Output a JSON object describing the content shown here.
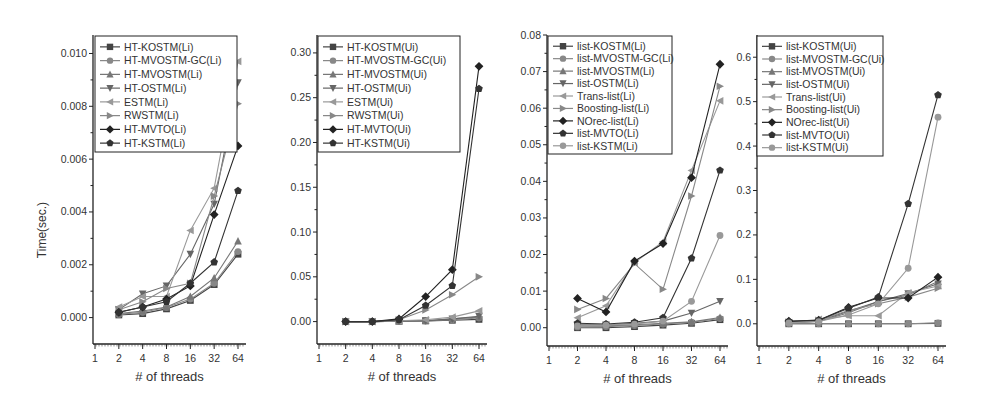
{
  "figure": {
    "y_axis_title": "Time(sec.)",
    "x_axis_title": "# of threads"
  },
  "chart_data": [
    {
      "type": "line",
      "title": "",
      "xlabel": "# of threads",
      "ylabel": "Time(sec.)",
      "x_scale": "log2",
      "categories": [
        "2",
        "4",
        "8",
        "16",
        "32",
        "64"
      ],
      "x_ticks": [
        "1",
        "2",
        "4",
        "8",
        "16",
        "32",
        "64"
      ],
      "y_ticks": [
        "0.000",
        "0.002",
        "0.004",
        "0.006",
        "0.008",
        "0.010"
      ],
      "ylim": [
        -0.001,
        0.0107
      ],
      "legend_position": "upper-left",
      "grid": false,
      "series": [
        {
          "name": "HT-KOSTM(Li)",
          "marker": "square",
          "color": "#444444",
          "values": [
            0.0001,
            0.00015,
            0.00033,
            0.00065,
            0.00125,
            0.0024
          ]
        },
        {
          "name": "HT-MVOSTM-GC(Li)",
          "marker": "circle",
          "color": "#888888",
          "values": [
            0.00012,
            0.0002,
            0.00038,
            0.0007,
            0.0013,
            0.0025
          ]
        },
        {
          "name": "HT-MVOSTM(Li)",
          "marker": "triangle-up",
          "color": "#777777",
          "values": [
            0.00015,
            0.00025,
            0.0004,
            0.0008,
            0.0015,
            0.0029
          ]
        },
        {
          "name": "HT-OSTM(Li)",
          "marker": "triangle-down",
          "color": "#666666",
          "values": [
            0.0003,
            0.0009,
            0.0012,
            0.0024,
            0.0043,
            0.0089
          ]
        },
        {
          "name": "ESTM(Li)",
          "marker": "triangle-left",
          "color": "#999999",
          "values": [
            0.0004,
            0.0008,
            0.0008,
            0.0033,
            0.0049,
            0.0097
          ]
        },
        {
          "name": "RWSTM(Li)",
          "marker": "triangle-right",
          "color": "#888888",
          "values": [
            0.0003,
            0.0006,
            0.0011,
            0.0013,
            0.0046,
            0.0081
          ]
        },
        {
          "name": "HT-MVTO(Li)",
          "marker": "diamond",
          "color": "#222222",
          "values": [
            0.0002,
            0.0004,
            0.0007,
            0.0012,
            0.0039,
            0.0065
          ]
        },
        {
          "name": "HT-KSTM(Li)",
          "marker": "pentagon",
          "color": "#333333",
          "values": [
            0.0002,
            0.0004,
            0.0006,
            0.0013,
            0.0021,
            0.0048
          ]
        }
      ]
    },
    {
      "type": "line",
      "title": "",
      "xlabel": "# of threads",
      "ylabel": "",
      "x_scale": "log2",
      "categories": [
        "2",
        "4",
        "8",
        "16",
        "32",
        "64"
      ],
      "x_ticks": [
        "1",
        "2",
        "4",
        "8",
        "16",
        "32",
        "64"
      ],
      "y_ticks": [
        "0.00",
        "0.05",
        "0.10",
        "0.15",
        "0.20",
        "0.25",
        "0.30"
      ],
      "ylim": [
        -0.025,
        0.32
      ],
      "legend_position": "upper-left",
      "grid": false,
      "series": [
        {
          "name": "HT-KOSTM(Ui)",
          "marker": "square",
          "color": "#444444",
          "values": [
            0.0,
            0.0,
            0.0005,
            0.0008,
            0.0015,
            0.0025
          ]
        },
        {
          "name": "HT-MVOSTM-GC(Ui)",
          "marker": "circle",
          "color": "#888888",
          "values": [
            0.0,
            0.0,
            0.0005,
            0.0008,
            0.002,
            0.004
          ]
        },
        {
          "name": "HT-MVOSTM(Ui)",
          "marker": "triangle-up",
          "color": "#777777",
          "values": [
            0.0,
            0.0,
            0.0006,
            0.001,
            0.003,
            0.005
          ]
        },
        {
          "name": "HT-OSTM(Ui)",
          "marker": "triangle-down",
          "color": "#666666",
          "values": [
            0.0,
            0.0,
            0.0008,
            0.001,
            0.003,
            0.006
          ]
        },
        {
          "name": "ESTM(Ui)",
          "marker": "triangle-left",
          "color": "#999999",
          "values": [
            0.0,
            0.0,
            0.001,
            0.002,
            0.005,
            0.012
          ]
        },
        {
          "name": "RWSTM(Ui)",
          "marker": "triangle-right",
          "color": "#888888",
          "values": [
            0.0,
            0.0,
            0.002,
            0.013,
            0.03,
            0.05
          ]
        },
        {
          "name": "HT-MVTO(Ui)",
          "marker": "diamond",
          "color": "#222222",
          "values": [
            0.0,
            0.0,
            0.003,
            0.028,
            0.058,
            0.285
          ]
        },
        {
          "name": "HT-KSTM(Ui)",
          "marker": "pentagon",
          "color": "#333333",
          "values": [
            0.0,
            0.0,
            0.002,
            0.018,
            0.04,
            0.26
          ]
        }
      ]
    },
    {
      "type": "line",
      "title": "",
      "xlabel": "# of threads",
      "ylabel": "",
      "x_scale": "log2",
      "categories": [
        "2",
        "4",
        "8",
        "16",
        "32",
        "64"
      ],
      "x_ticks": [
        "1",
        "2",
        "4",
        "8",
        "16",
        "32",
        "64"
      ],
      "y_ticks": [
        "0.00",
        "0.01",
        "0.02",
        "0.03",
        "0.04",
        "0.05",
        "0.06",
        "0.07",
        "0.08"
      ],
      "ylim": [
        -0.005,
        0.08
      ],
      "legend_position": "upper-left",
      "grid": false,
      "series": [
        {
          "name": "list-KOSTM(Li)",
          "marker": "square",
          "color": "#444444",
          "values": [
            0.0,
            0.0,
            0.0003,
            0.0007,
            0.0012,
            0.0022
          ]
        },
        {
          "name": "list-MVOSTM-GC(Li)",
          "marker": "circle",
          "color": "#888888",
          "values": [
            0.0002,
            0.0003,
            0.0006,
            0.001,
            0.0015,
            0.0025
          ]
        },
        {
          "name": "list-MVOSTM(Li)",
          "marker": "triangle-up",
          "color": "#777777",
          "values": [
            0.0005,
            0.0005,
            0.0008,
            0.0012,
            0.0016,
            0.0028
          ]
        },
        {
          "name": "list-OSTM(Li)",
          "marker": "triangle-down",
          "color": "#666666",
          "values": [
            0.0008,
            0.0008,
            0.0012,
            0.0018,
            0.004,
            0.0072
          ]
        },
        {
          "name": "Trans-list(Li)",
          "marker": "triangle-left",
          "color": "#999999",
          "values": [
            0.0027,
            0.006,
            0.0178,
            0.0235,
            0.043,
            0.062
          ]
        },
        {
          "name": "Boosting-list(Li)",
          "marker": "triangle-right",
          "color": "#888888",
          "values": [
            0.005,
            0.008,
            0.0175,
            0.0105,
            0.036,
            0.066
          ]
        },
        {
          "name": "NOrec-list(Li)",
          "marker": "diamond",
          "color": "#222222",
          "values": [
            0.008,
            0.0043,
            0.0182,
            0.023,
            0.041,
            0.072
          ]
        },
        {
          "name": "list-MVTO(Li)",
          "marker": "pentagon",
          "color": "#333333",
          "values": [
            0.0012,
            0.001,
            0.0015,
            0.0027,
            0.019,
            0.043
          ]
        },
        {
          "name": "list-KSTM(Li)",
          "marker": "circle",
          "color": "#999999",
          "values": [
            0.0005,
            0.0007,
            0.001,
            0.0018,
            0.0072,
            0.0252
          ]
        }
      ]
    },
    {
      "type": "line",
      "title": "",
      "xlabel": "# of threads",
      "ylabel": "",
      "x_scale": "log2",
      "categories": [
        "2",
        "4",
        "8",
        "16",
        "32",
        "64"
      ],
      "x_ticks": [
        "1",
        "2",
        "4",
        "8",
        "16",
        "32",
        "64"
      ],
      "y_ticks": [
        "0.0",
        "0.1",
        "0.2",
        "0.3",
        "0.4",
        "0.5",
        "0.6"
      ],
      "ylim": [
        -0.05,
        0.65
      ],
      "legend_position": "upper-left",
      "grid": false,
      "series": [
        {
          "name": "list-KOSTM(Ui)",
          "marker": "square",
          "color": "#444444",
          "values": [
            0.0,
            0.0,
            0.0,
            0.0,
            0.0,
            0.001
          ]
        },
        {
          "name": "list-MVOSTM-GC(Ui)",
          "marker": "circle",
          "color": "#888888",
          "values": [
            0.0,
            0.0,
            0.0,
            0.0,
            0.0,
            0.002
          ]
        },
        {
          "name": "list-MVOSTM(Ui)",
          "marker": "triangle-up",
          "color": "#777777",
          "values": [
            0.002,
            0.005,
            0.025,
            0.05,
            0.065,
            0.095
          ]
        },
        {
          "name": "list-OSTM(Ui)",
          "marker": "triangle-down",
          "color": "#666666",
          "values": [
            0.003,
            0.006,
            0.028,
            0.05,
            0.068,
            0.09
          ]
        },
        {
          "name": "Trans-list(Ui)",
          "marker": "triangle-left",
          "color": "#999999",
          "values": [
            0.003,
            0.01,
            0.018,
            0.018,
            0.07,
            0.085
          ]
        },
        {
          "name": "Boosting-list(Ui)",
          "marker": "triangle-right",
          "color": "#888888",
          "values": [
            0.004,
            0.008,
            0.03,
            0.045,
            0.06,
            0.08
          ]
        },
        {
          "name": "NOrec-list(Ui)",
          "marker": "diamond",
          "color": "#222222",
          "values": [
            0.006,
            0.008,
            0.037,
            0.058,
            0.058,
            0.105
          ]
        },
        {
          "name": "list-MVTO(Ui)",
          "marker": "pentagon",
          "color": "#333333",
          "values": [
            0.005,
            0.008,
            0.035,
            0.06,
            0.27,
            0.515
          ]
        },
        {
          "name": "list-KSTM(Ui)",
          "marker": "circle",
          "color": "#999999",
          "values": [
            0.002,
            0.005,
            0.02,
            0.045,
            0.125,
            0.465
          ]
        }
      ]
    }
  ]
}
